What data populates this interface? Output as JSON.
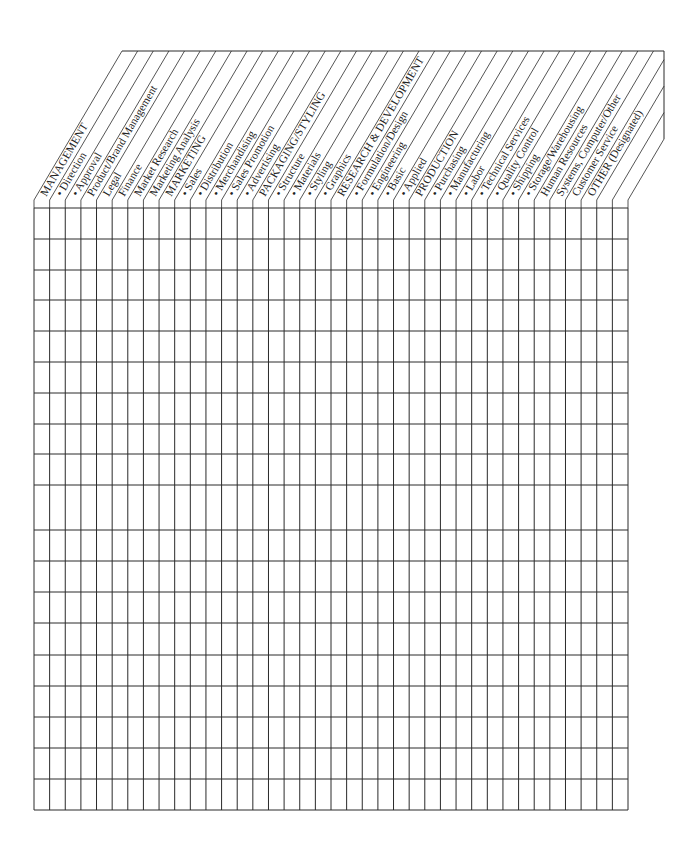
{
  "form": {
    "columns": [
      {
        "label": "MANAGEMENT",
        "bullet": false
      },
      {
        "label": "Direction",
        "bullet": true
      },
      {
        "label": "Approval",
        "bullet": true
      },
      {
        "label": "Product/Brand Management",
        "bullet": false
      },
      {
        "label": "Legal",
        "bullet": false
      },
      {
        "label": "Finance",
        "bullet": false
      },
      {
        "label": "Market Research",
        "bullet": false
      },
      {
        "label": "Marketing Analysis",
        "bullet": false
      },
      {
        "label": "MARKETING",
        "bullet": false
      },
      {
        "label": "Sales",
        "bullet": true
      },
      {
        "label": "Distribution",
        "bullet": true
      },
      {
        "label": "Merchandising",
        "bullet": true
      },
      {
        "label": "Sales Promotion",
        "bullet": true
      },
      {
        "label": "Advertising",
        "bullet": true
      },
      {
        "label": "PACKAGING/STYLING",
        "bullet": false
      },
      {
        "label": "Structure",
        "bullet": true
      },
      {
        "label": "Materials",
        "bullet": true
      },
      {
        "label": "Styling",
        "bullet": true
      },
      {
        "label": "Graphics",
        "bullet": true
      },
      {
        "label": "RESEARCH & DEVELOPMENT",
        "bullet": false
      },
      {
        "label": "Formulation/Design",
        "bullet": true
      },
      {
        "label": "Engineering",
        "bullet": true
      },
      {
        "label": "Basic",
        "bullet": true
      },
      {
        "label": "Applied",
        "bullet": true
      },
      {
        "label": "PRODUCTION",
        "bullet": false
      },
      {
        "label": "Purchasing",
        "bullet": true
      },
      {
        "label": "Manufacturing",
        "bullet": true
      },
      {
        "label": "Labor",
        "bullet": true
      },
      {
        "label": "Technical Services",
        "bullet": true
      },
      {
        "label": "Quality Control",
        "bullet": true
      },
      {
        "label": "Shipping",
        "bullet": true
      },
      {
        "label": "Storage/Warehousing",
        "bullet": true
      },
      {
        "label": "Human Resources",
        "bullet": false
      },
      {
        "label": "Systems, Computer/Other",
        "bullet": false
      },
      {
        "label": "Customer Service",
        "bullet": false
      },
      {
        "label": "OTHER (Designated)",
        "bullet": false
      },
      {
        "label": "",
        "bullet": false
      },
      {
        "label": "",
        "bullet": false
      }
    ],
    "bullet_glyph": "•",
    "row_count": 19,
    "row_lines_y": [
      208,
      239,
      270,
      300,
      331,
      362,
      393,
      424,
      454,
      485,
      530,
      561,
      592,
      623,
      655,
      686,
      717,
      748,
      779,
      810
    ],
    "line_color": "#2a2a2a"
  }
}
